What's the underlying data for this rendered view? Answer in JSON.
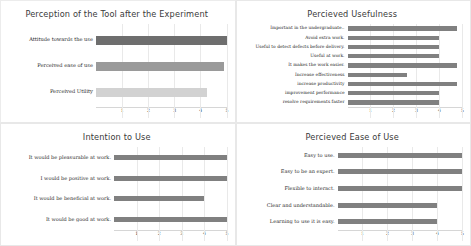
{
  "figure": {
    "background": "#ffffff",
    "panel_border": "#e8e8e8",
    "gridline_color": "#e9e9e9",
    "default_bar_color": "#808080"
  },
  "charts": [
    {
      "id": "perception-of-the-tool",
      "type": "bar",
      "orientation": "horizontal",
      "title": "Perception of the Tool after the Experiment",
      "xlabel": "",
      "ylabel": "",
      "xlim": [
        0,
        5
      ],
      "xticks": [
        "1",
        "2",
        "3",
        "4",
        "5"
      ],
      "xtick_values": [
        1,
        2,
        3,
        4,
        5
      ],
      "grid": true,
      "legend": "none",
      "categories": [
        "Attitude towards the use",
        "Perceived ease of use",
        "Perceived Utility"
      ],
      "values": [
        5.0,
        4.92,
        4.25
      ],
      "bar_colors": [
        "#6e6e6e",
        "#9a9a9a",
        "#d2d2d2"
      ]
    },
    {
      "id": "percieved-usefulness",
      "type": "bar",
      "orientation": "horizontal",
      "title": "Percieved Usefulness",
      "xlabel": "",
      "ylabel": "",
      "xlim": [
        0,
        5
      ],
      "xticks": [
        "1",
        "2",
        "3",
        "4",
        "5"
      ],
      "xtick_values": [
        1,
        2,
        3,
        4,
        5
      ],
      "grid": true,
      "legend": "none",
      "categories": [
        "Important in the undergraduate..",
        "Avoid extra work.",
        "Useful to detect defects before delivery.",
        "Useful at work.",
        "It makes the work easier.",
        "Increase effectiveness",
        "increase productivity",
        "improvement performance",
        "resolve requirements faster"
      ],
      "values": [
        4.8,
        4.0,
        4.0,
        4.0,
        4.8,
        2.6,
        4.8,
        4.0,
        4.0
      ],
      "bar_color": "#808080"
    },
    {
      "id": "intention-to-use",
      "type": "bar",
      "orientation": "horizontal",
      "title": "Intention to Use",
      "xlabel": "",
      "ylabel": "",
      "xlim": [
        0,
        5
      ],
      "xticks": [
        "1",
        "2",
        "3",
        "4",
        "5"
      ],
      "xtick_values": [
        1,
        2,
        3,
        4,
        5
      ],
      "grid": true,
      "legend": "none",
      "categories": [
        "It would be pleasurable at work.",
        "I would be positive at work.",
        "It would be beneficial at work.",
        "It would be good at work."
      ],
      "values": [
        5.0,
        5.0,
        4.0,
        5.0
      ],
      "bar_color": "#808080"
    },
    {
      "id": "percieved-ease-of-use",
      "type": "bar",
      "orientation": "horizontal",
      "title": "Percieved Ease of Use",
      "xlabel": "",
      "ylabel": "",
      "xlim": [
        0,
        5
      ],
      "xticks": [
        "1",
        "2",
        "3",
        "4",
        "5"
      ],
      "xtick_values": [
        1,
        2,
        3,
        4,
        5
      ],
      "grid": true,
      "legend": "none",
      "categories": [
        "Easy to use.",
        "Easy to be an expert.",
        "Flexible to interact.",
        "Clear and understandable.",
        "Learning to use it is easy."
      ],
      "values": [
        5.0,
        5.0,
        5.0,
        4.0,
        4.0
      ],
      "bar_color": "#808080"
    }
  ],
  "chart_data": [
    {
      "type": "bar",
      "title": "Perception of the Tool after the Experiment",
      "categories": [
        "Attitude towards the use",
        "Perceived ease of use",
        "Perceived Utility"
      ],
      "values": [
        5.0,
        4.92,
        4.25
      ],
      "xlabel": "",
      "ylabel": "",
      "xlim": [
        0,
        5
      ],
      "grid": true,
      "legend_position": "none"
    },
    {
      "type": "bar",
      "title": "Percieved Usefulness",
      "categories": [
        "Important in the undergraduate..",
        "Avoid extra work.",
        "Useful to detect defects before delivery.",
        "Useful at work.",
        "It makes the work easier.",
        "Increase effectiveness",
        "increase productivity",
        "improvement performance",
        "resolve requirements faster"
      ],
      "values": [
        4.8,
        4.0,
        4.0,
        4.0,
        4.8,
        2.6,
        4.8,
        4.0,
        4.0
      ],
      "xlabel": "",
      "ylabel": "",
      "xlim": [
        0,
        5
      ],
      "grid": true,
      "legend_position": "none"
    },
    {
      "type": "bar",
      "title": "Intention to Use",
      "categories": [
        "It would be pleasurable at work.",
        "I would be positive at work.",
        "It would be beneficial at work.",
        "It would be good at work."
      ],
      "values": [
        5.0,
        5.0,
        4.0,
        5.0
      ],
      "xlabel": "",
      "ylabel": "",
      "xlim": [
        0,
        5
      ],
      "grid": true,
      "legend_position": "none"
    },
    {
      "type": "bar",
      "title": "Percieved Ease of Use",
      "categories": [
        "Easy to use.",
        "Easy to be an expert.",
        "Flexible to interact.",
        "Clear and understandable.",
        "Learning to use it is easy."
      ],
      "values": [
        5.0,
        5.0,
        5.0,
        4.0,
        4.0
      ],
      "xlabel": "",
      "ylabel": "",
      "xlim": [
        0,
        5
      ],
      "grid": true,
      "legend_position": "none"
    }
  ]
}
